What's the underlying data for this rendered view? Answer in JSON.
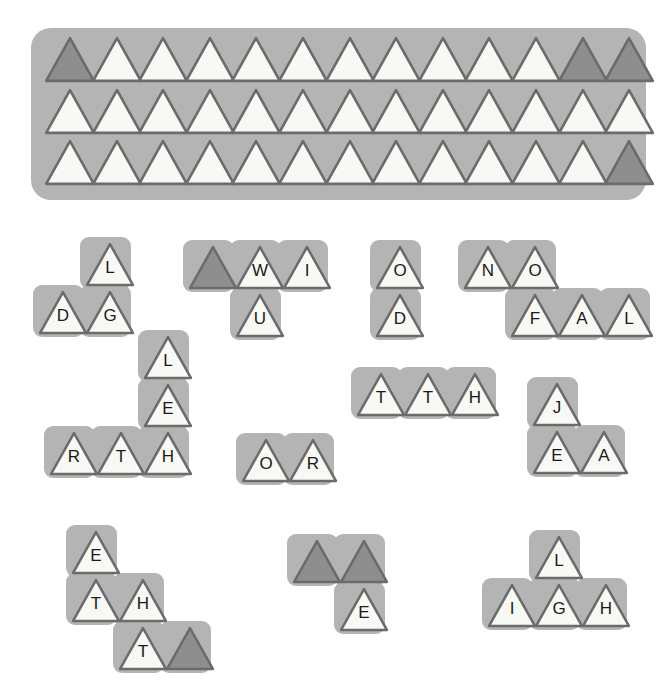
{
  "app": {
    "title": "Triangle Letter Tile Puzzle",
    "background_color": "#ffffff",
    "tile_tray_color": "#b4b4b4",
    "tile_fill_blank": "#8e8e8e",
    "tile_fill_letter": "#f8f8f4",
    "tile_outline_color": "#6b6b6b",
    "letter_color": "#1a1a1a"
  },
  "tray": {
    "name": "tray-grid",
    "columns": 13,
    "rows": 3,
    "cells": [
      [
        {
          "letter": "",
          "state": "blank"
        },
        {
          "letter": "",
          "state": "empty"
        },
        {
          "letter": "",
          "state": "empty"
        },
        {
          "letter": "",
          "state": "empty"
        },
        {
          "letter": "",
          "state": "empty"
        },
        {
          "letter": "",
          "state": "empty"
        },
        {
          "letter": "",
          "state": "empty"
        },
        {
          "letter": "",
          "state": "empty"
        },
        {
          "letter": "",
          "state": "empty"
        },
        {
          "letter": "",
          "state": "empty"
        },
        {
          "letter": "",
          "state": "empty"
        },
        {
          "letter": "",
          "state": "blank"
        },
        {
          "letter": "",
          "state": "blank"
        }
      ],
      [
        {
          "letter": "",
          "state": "empty"
        },
        {
          "letter": "",
          "state": "empty"
        },
        {
          "letter": "",
          "state": "empty"
        },
        {
          "letter": "",
          "state": "empty"
        },
        {
          "letter": "",
          "state": "empty"
        },
        {
          "letter": "",
          "state": "empty"
        },
        {
          "letter": "",
          "state": "empty"
        },
        {
          "letter": "",
          "state": "empty"
        },
        {
          "letter": "",
          "state": "empty"
        },
        {
          "letter": "",
          "state": "empty"
        },
        {
          "letter": "",
          "state": "empty"
        },
        {
          "letter": "",
          "state": "empty"
        },
        {
          "letter": "",
          "state": "empty"
        }
      ],
      [
        {
          "letter": "",
          "state": "empty"
        },
        {
          "letter": "",
          "state": "empty"
        },
        {
          "letter": "",
          "state": "empty"
        },
        {
          "letter": "",
          "state": "empty"
        },
        {
          "letter": "",
          "state": "empty"
        },
        {
          "letter": "",
          "state": "empty"
        },
        {
          "letter": "",
          "state": "empty"
        },
        {
          "letter": "",
          "state": "empty"
        },
        {
          "letter": "",
          "state": "empty"
        },
        {
          "letter": "",
          "state": "empty"
        },
        {
          "letter": "",
          "state": "empty"
        },
        {
          "letter": "",
          "state": "empty"
        },
        {
          "letter": "",
          "state": "blank"
        }
      ]
    ]
  },
  "pieces": [
    {
      "name": "piece-dgl",
      "x": 33,
      "y": 237,
      "tiles": [
        {
          "col": 1,
          "row": 0,
          "letter": "L",
          "state": "letter"
        },
        {
          "col": 0,
          "row": 1,
          "letter": "D",
          "state": "letter"
        },
        {
          "col": 1,
          "row": 1,
          "letter": "G",
          "state": "letter"
        }
      ]
    },
    {
      "name": "piece-wiu",
      "x": 183,
      "y": 240,
      "tiles": [
        {
          "col": 0,
          "row": 0,
          "letter": "",
          "state": "blank"
        },
        {
          "col": 1,
          "row": 0,
          "letter": "W",
          "state": "letter"
        },
        {
          "col": 2,
          "row": 0,
          "letter": "I",
          "state": "letter"
        },
        {
          "col": 1,
          "row": 1,
          "letter": "U",
          "state": "letter"
        }
      ]
    },
    {
      "name": "piece-od",
      "x": 370,
      "y": 240,
      "tiles": [
        {
          "col": 0,
          "row": 0,
          "letter": "O",
          "state": "letter"
        },
        {
          "col": 0,
          "row": 1,
          "letter": "D",
          "state": "letter"
        }
      ]
    },
    {
      "name": "piece-nofal",
      "x": 458,
      "y": 240,
      "tiles": [
        {
          "col": 0,
          "row": 0,
          "letter": "N",
          "state": "letter"
        },
        {
          "col": 1,
          "row": 0,
          "letter": "O",
          "state": "letter"
        },
        {
          "col": 1,
          "row": 1,
          "letter": "F",
          "state": "letter"
        },
        {
          "col": 2,
          "row": 1,
          "letter": "A",
          "state": "letter"
        },
        {
          "col": 3,
          "row": 1,
          "letter": "L",
          "state": "letter"
        }
      ]
    },
    {
      "name": "piece-lerth",
      "x": 44,
      "y": 330,
      "tiles": [
        {
          "col": 2,
          "row": 0,
          "letter": "L",
          "state": "letter"
        },
        {
          "col": 2,
          "row": 1,
          "letter": "E",
          "state": "letter"
        },
        {
          "col": 0,
          "row": 2,
          "letter": "R",
          "state": "letter"
        },
        {
          "col": 1,
          "row": 2,
          "letter": "T",
          "state": "letter"
        },
        {
          "col": 2,
          "row": 2,
          "letter": "H",
          "state": "letter"
        }
      ]
    },
    {
      "name": "piece-tth",
      "x": 351,
      "y": 367,
      "tiles": [
        {
          "col": 0,
          "row": 0,
          "letter": "T",
          "state": "letter"
        },
        {
          "col": 1,
          "row": 0,
          "letter": "T",
          "state": "letter"
        },
        {
          "col": 2,
          "row": 0,
          "letter": "H",
          "state": "letter"
        }
      ]
    },
    {
      "name": "piece-or",
      "x": 236,
      "y": 433,
      "tiles": [
        {
          "col": 0,
          "row": 0,
          "letter": "O",
          "state": "letter"
        },
        {
          "col": 1,
          "row": 0,
          "letter": "R",
          "state": "letter"
        }
      ]
    },
    {
      "name": "piece-jea",
      "x": 527,
      "y": 377,
      "tiles": [
        {
          "col": 0,
          "row": 0,
          "letter": "J",
          "state": "letter"
        },
        {
          "col": 0,
          "row": 1,
          "letter": "E",
          "state": "letter"
        },
        {
          "col": 1,
          "row": 1,
          "letter": "A",
          "state": "letter"
        }
      ]
    },
    {
      "name": "piece-ethT",
      "x": 66,
      "y": 525,
      "tiles": [
        {
          "col": 0,
          "row": 0,
          "letter": "E",
          "state": "letter"
        },
        {
          "col": 0,
          "row": 1,
          "letter": "T",
          "state": "letter"
        },
        {
          "col": 1,
          "row": 1,
          "letter": "H",
          "state": "letter"
        },
        {
          "col": 1,
          "row": 2,
          "letter": "T",
          "state": "letter"
        },
        {
          "col": 2,
          "row": 2,
          "letter": "",
          "state": "blank"
        }
      ]
    },
    {
      "name": "piece-blank-blank-e",
      "x": 287,
      "y": 534,
      "tiles": [
        {
          "col": 0,
          "row": 0,
          "letter": "",
          "state": "blank"
        },
        {
          "col": 1,
          "row": 0,
          "letter": "",
          "state": "blank"
        },
        {
          "col": 1,
          "row": 1,
          "letter": "E",
          "state": "letter"
        }
      ]
    },
    {
      "name": "piece-ligh",
      "x": 482,
      "y": 530,
      "tiles": [
        {
          "col": 1,
          "row": 0,
          "letter": "L",
          "state": "letter"
        },
        {
          "col": 0,
          "row": 1,
          "letter": "I",
          "state": "letter"
        },
        {
          "col": 1,
          "row": 1,
          "letter": "G",
          "state": "letter"
        },
        {
          "col": 2,
          "row": 1,
          "letter": "H",
          "state": "letter"
        }
      ]
    }
  ]
}
